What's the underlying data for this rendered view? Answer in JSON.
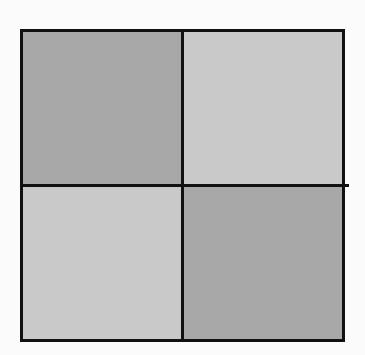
{
  "diagram": {
    "type": "2x2 checkerboard grid",
    "rows": 2,
    "cols": 2,
    "cells": [
      {
        "row": 0,
        "col": 0,
        "shade": "dark",
        "color": "#a8a8a8"
      },
      {
        "row": 0,
        "col": 1,
        "shade": "light",
        "color": "#c9c9c9"
      },
      {
        "row": 1,
        "col": 0,
        "shade": "light",
        "color": "#c9c9c9"
      },
      {
        "row": 1,
        "col": 1,
        "shade": "dark",
        "color": "#a8a8a8"
      }
    ],
    "border_color": "#111111",
    "background_color": "#fbfbfb"
  }
}
